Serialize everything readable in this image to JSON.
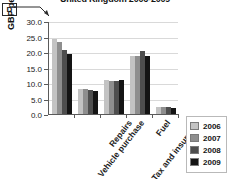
{
  "callout": {
    "label": "D"
  },
  "chart_data": {
    "type": "bar",
    "title": "United Kingdom 2006-2009",
    "xlabel": "",
    "ylabel": "GBP per week",
    "ylim": [
      0.0,
      30.0
    ],
    "ytick_labels": [
      "30.0",
      "25.0",
      "20.0",
      "15.0",
      "10.0",
      "5.0",
      "0.0"
    ],
    "ytick_values": [
      30.0,
      25.0,
      20.0,
      15.0,
      10.0,
      5.0,
      0.0
    ],
    "grid": true,
    "legend_position": "right",
    "categories": [
      "Vehicle purchase",
      "Repairs",
      "Tax and insurance",
      "Fuel",
      "Other costs"
    ],
    "series": [
      {
        "name": "2006",
        "color": "#c3c3c3",
        "values": [
          24.3,
          8.0,
          11.0,
          18.7,
          2.2
        ]
      },
      {
        "name": "2007",
        "color": "#8e8e8e",
        "values": [
          23.3,
          8.0,
          10.5,
          18.8,
          2.2
        ]
      },
      {
        "name": "2008",
        "color": "#4e4e4e",
        "values": [
          20.5,
          7.8,
          10.8,
          20.3,
          2.2
        ]
      },
      {
        "name": "2009",
        "color": "#141414",
        "values": [
          19.2,
          7.5,
          11.0,
          18.8,
          2.1
        ]
      }
    ]
  }
}
